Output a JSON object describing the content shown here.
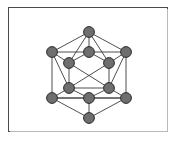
{
  "figure": {
    "frame": {
      "border_color": "#4a4a4a",
      "background_color": "#ffffff",
      "x": 8,
      "y": 7,
      "width": 160,
      "height": 125
    }
  },
  "chart_data": {
    "type": "diagram",
    "subtype": "graph-node-link",
    "xlabel": "",
    "ylabel": "",
    "grid": false,
    "legend": false,
    "node_count": 12,
    "edge_count": 30,
    "node_style": {
      "fill": "#6e6e6e",
      "stroke": "#2b2b2b",
      "radius": 5.4
    },
    "edge_style": {
      "stroke": "#3b3b3b",
      "width": 0.9
    },
    "nodes": [
      {
        "id": "top",
        "label": "1",
        "x": 89,
        "y": 32
      },
      {
        "id": "ul",
        "label": "2",
        "x": 52,
        "y": 52
      },
      {
        "id": "um",
        "label": "3",
        "x": 89,
        "y": 52
      },
      {
        "id": "ur",
        "label": "4",
        "x": 126,
        "y": 52
      },
      {
        "id": "il",
        "label": "5",
        "x": 69,
        "y": 63
      },
      {
        "id": "ir",
        "label": "6",
        "x": 109,
        "y": 63
      },
      {
        "id": "ml",
        "label": "7",
        "x": 69,
        "y": 88
      },
      {
        "id": "mr",
        "label": "8",
        "x": 109,
        "y": 88
      },
      {
        "id": "ll",
        "label": "9",
        "x": 52,
        "y": 98
      },
      {
        "id": "lm",
        "label": "10",
        "x": 89,
        "y": 98
      },
      {
        "id": "lr",
        "label": "11",
        "x": 126,
        "y": 98
      },
      {
        "id": "bot",
        "label": "12",
        "x": 89,
        "y": 118
      }
    ],
    "edges": [
      [
        "top",
        "ul"
      ],
      [
        "top",
        "um"
      ],
      [
        "top",
        "ur"
      ],
      [
        "top",
        "il"
      ],
      [
        "top",
        "ir"
      ],
      [
        "ul",
        "um"
      ],
      [
        "um",
        "ur"
      ],
      [
        "ul",
        "il"
      ],
      [
        "il",
        "um"
      ],
      [
        "um",
        "ir"
      ],
      [
        "ir",
        "ur"
      ],
      [
        "ul",
        "ll"
      ],
      [
        "ur",
        "lr"
      ],
      [
        "ul",
        "ml"
      ],
      [
        "ur",
        "mr"
      ],
      [
        "il",
        "ml"
      ],
      [
        "ir",
        "mr"
      ],
      [
        "il",
        "mr"
      ],
      [
        "ir",
        "ml"
      ],
      [
        "ml",
        "mr"
      ],
      [
        "ml",
        "ll"
      ],
      [
        "mr",
        "lr"
      ],
      [
        "ml",
        "lm"
      ],
      [
        "mr",
        "lm"
      ],
      [
        "ll",
        "lm"
      ],
      [
        "lm",
        "lr"
      ],
      [
        "ll",
        "lr"
      ],
      [
        "ll",
        "bot"
      ],
      [
        "lm",
        "bot"
      ],
      [
        "lr",
        "bot"
      ]
    ]
  }
}
